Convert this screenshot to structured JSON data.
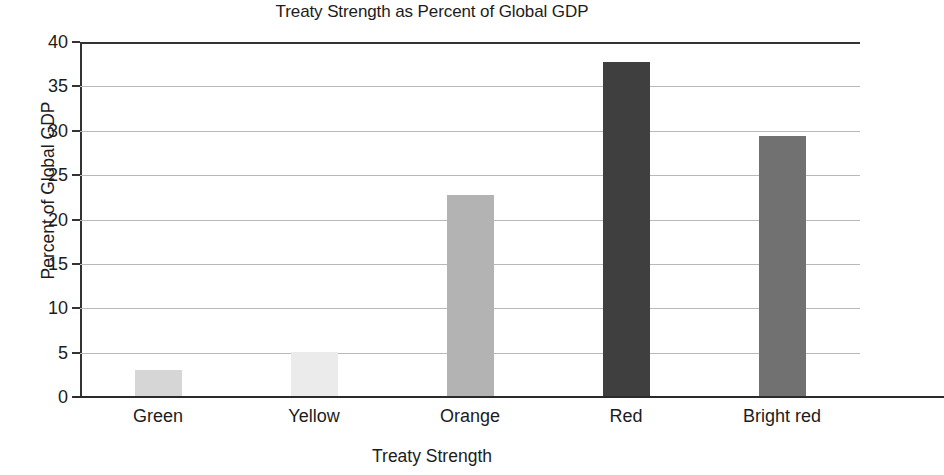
{
  "chart_data": {
    "type": "bar",
    "title": "Treaty Strength as Percent of Global GDP",
    "xlabel": "Treaty Strength",
    "ylabel": "Percent of Global GDP",
    "categories": [
      "Green",
      "Yellow",
      "Orange",
      "Red",
      "Bright red"
    ],
    "values": [
      3.0,
      5.1,
      22.8,
      37.7,
      29.4
    ],
    "bar_colors": [
      "#d6d6d6",
      "#ebebeb",
      "#b3b3b3",
      "#3f3f3f",
      "#717171"
    ],
    "ylim": [
      0,
      40
    ],
    "yticks": [
      0,
      5,
      10,
      15,
      20,
      25,
      30,
      35,
      40
    ],
    "ytick_labels": [
      "0",
      "5",
      "10",
      "15",
      "20",
      "25",
      "30",
      "35",
      "40"
    ],
    "grid": true,
    "grid_axis": "y",
    "legend": null,
    "series": [
      {
        "name": "Percent of Global GDP",
        "values": [
          3.0,
          5.1,
          22.8,
          37.7,
          29.4
        ]
      }
    ]
  },
  "style": {
    "background": "#ffffff",
    "axis_color": "#333333",
    "grid_color": "#b9b9b9",
    "text_color": "#1c1c1c"
  }
}
